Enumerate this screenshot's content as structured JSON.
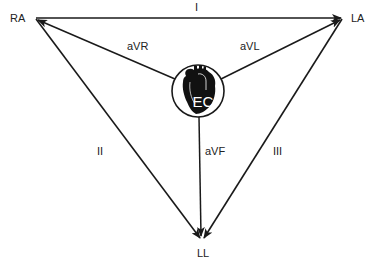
{
  "diagram": {
    "vertices": {
      "ra": {
        "label": "RA",
        "x": 35,
        "y": 18
      },
      "la": {
        "label": "LA",
        "x": 343,
        "y": 18
      },
      "ll": {
        "label": "LL",
        "x": 202,
        "y": 240
      }
    },
    "center": {
      "label": "EC",
      "x": 198,
      "y": 91,
      "r": 26
    },
    "leads": [
      {
        "name": "I",
        "from": "RA",
        "to": "LA"
      },
      {
        "name": "II",
        "from": "RA",
        "to": "LL"
      },
      {
        "name": "III",
        "from": "LA",
        "to": "LL"
      },
      {
        "name": "aVR",
        "from": "EC",
        "to": "RA"
      },
      {
        "name": "aVL",
        "from": "EC",
        "to": "LA"
      },
      {
        "name": "aVF",
        "from": "EC",
        "to": "LL"
      }
    ],
    "labels": {
      "ra": "RA",
      "la": "LA",
      "ll": "LL",
      "ec": "EC",
      "lead_i": "I",
      "lead_ii": "II",
      "lead_iii": "III",
      "lead_avr": "aVR",
      "lead_avl": "aVL",
      "lead_avf": "aVF"
    },
    "colors": {
      "line": "#1a1a1a",
      "heart": "#111111",
      "background": "#ffffff"
    }
  }
}
